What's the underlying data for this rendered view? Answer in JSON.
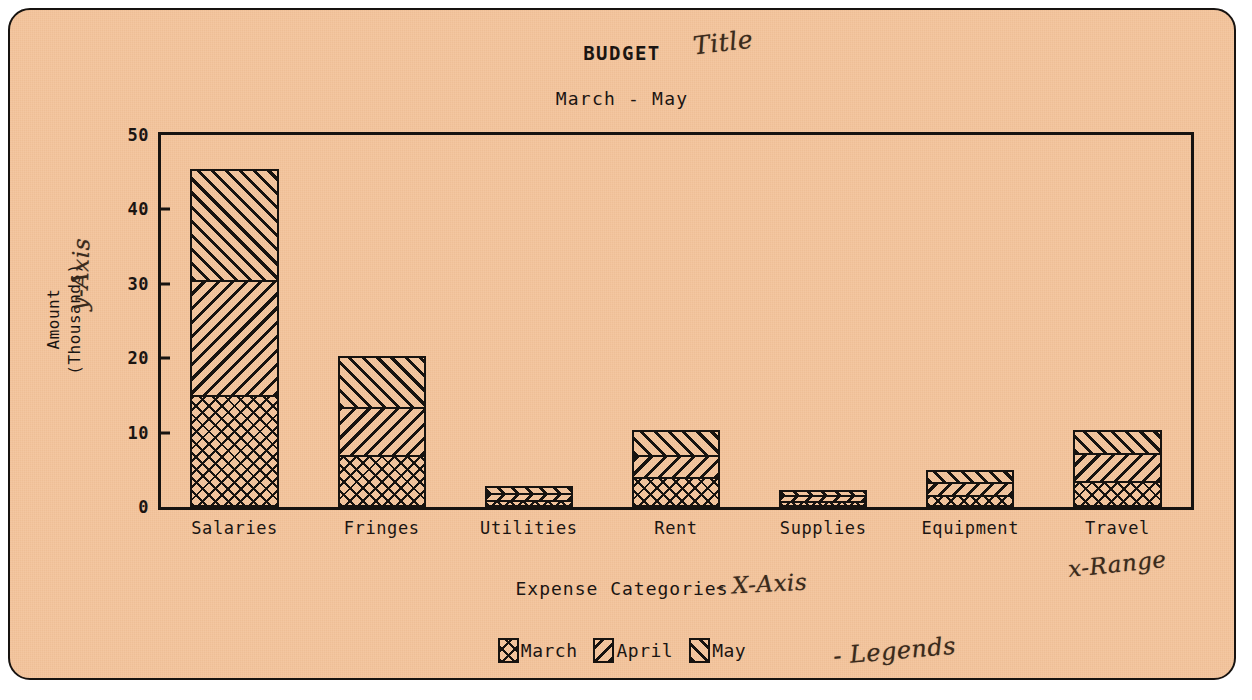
{
  "figure": {
    "background_color": "#f3c49c",
    "ink_color": "#171310",
    "handwriting_color": "#3a2a1c"
  },
  "annotations": {
    "title_note": "Title",
    "yaxis_note": "y-Axis",
    "xaxis_note": "- X-Axis",
    "xrange_note": "x-Range",
    "legend_note": "- Legends"
  },
  "legend": {
    "position": "bottom-center",
    "entries": [
      {
        "label": "March",
        "pattern": "crosshatch"
      },
      {
        "label": "April",
        "pattern": "diagonal-backslash"
      },
      {
        "label": "May",
        "pattern": "diagonal-forwardslash"
      }
    ]
  },
  "chart_data": {
    "type": "bar",
    "variant": "stacked",
    "title": "BUDGET",
    "subtitle": "March - May",
    "xlabel": "Expense Categories",
    "ylabel": "Amount (Thousands)",
    "ylabel_line1": "Amount",
    "ylabel_line2": "(Thousands)",
    "ylim": [
      0,
      50
    ],
    "yticks": [
      0,
      10,
      20,
      30,
      40,
      50
    ],
    "ytick_labels": [
      "0",
      "10",
      "20",
      "30",
      "40",
      "50"
    ],
    "grid": false,
    "categories": [
      "Salaries",
      "Fringes",
      "Utilities",
      "Rent",
      "Supplies",
      "Equipment",
      "Travel"
    ],
    "series": [
      {
        "name": "March",
        "pattern": "crosshatch",
        "values": [
          15.0,
          7.0,
          1.0,
          4.0,
          0.8,
          1.6,
          3.5
        ]
      },
      {
        "name": "April",
        "pattern": "diagonal-backslash",
        "values": [
          15.5,
          6.5,
          0.9,
          3.0,
          0.8,
          1.7,
          3.8
        ]
      },
      {
        "name": "May",
        "pattern": "diagonal-forwardslash",
        "values": [
          15.0,
          6.8,
          0.9,
          3.3,
          0.7,
          1.7,
          3.1
        ]
      }
    ],
    "totals": [
      45.5,
      20.3,
      2.8,
      10.3,
      2.3,
      5.0,
      10.4
    ]
  }
}
